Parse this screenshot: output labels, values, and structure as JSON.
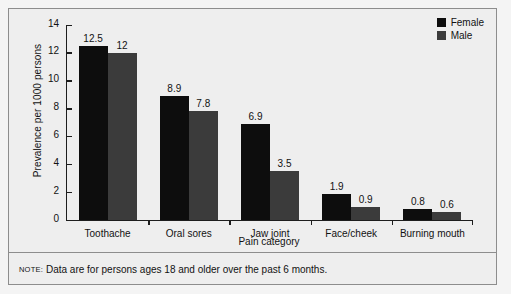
{
  "chart_data": {
    "type": "bar",
    "title": "",
    "xlabel": "Pain category",
    "ylabel": "Prevalence per 1000 persons",
    "categories": [
      "Toothache",
      "Oral sores",
      "Jaw joint",
      "Face/cheek",
      "Burning mouth"
    ],
    "series": [
      {
        "name": "Female",
        "color": "#0d0d0d",
        "values": [
          12.5,
          8.9,
          6.9,
          1.9,
          0.8
        ],
        "labels": [
          "12.5",
          "8.9",
          "6.9",
          "1.9",
          "0.8"
        ]
      },
      {
        "name": "Male",
        "color": "#3b3b3b",
        "values": [
          12,
          7.8,
          3.5,
          0.9,
          0.6
        ],
        "labels": [
          "12",
          "7.8",
          "3.5",
          "0.9",
          "0.6"
        ]
      }
    ],
    "ylim": [
      0,
      14
    ],
    "yticks": [
      0,
      2,
      4,
      6,
      8,
      10,
      12,
      14
    ],
    "ytick_labels": [
      "0",
      "2",
      "4",
      "6",
      "8",
      "10",
      "12",
      "14"
    ],
    "grid": false,
    "legend_position": "top-right"
  },
  "legend": {
    "items": [
      {
        "label": "Female",
        "color": "#0d0d0d"
      },
      {
        "label": "Male",
        "color": "#3b3b3b"
      }
    ]
  },
  "note": {
    "prefix": "NOTE:",
    "text": "Data are for persons ages 18 and older over the past 6 months."
  }
}
